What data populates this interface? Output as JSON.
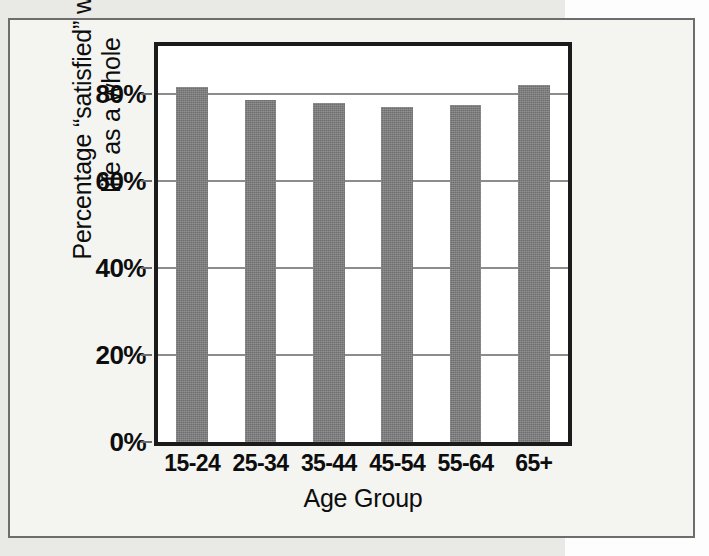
{
  "chart_data": {
    "type": "bar",
    "title": "",
    "subtitle": "",
    "xlabel": "Age Group",
    "ylabel": "Percentage “satisfied” with\nlife as a whole",
    "categories": [
      "15-24",
      "25-34",
      "35-44",
      "45-54",
      "55-64",
      "65+"
    ],
    "values": [
      81.5,
      78.5,
      78.0,
      77.0,
      77.5,
      82.0
    ],
    "series": [
      {
        "name": "Percentage satisfied with life as a whole",
        "values": [
          81.5,
          78.5,
          78.0,
          77.0,
          77.5,
          82.0
        ]
      }
    ],
    "ylim": [
      0,
      91
    ],
    "ytick_values": [
      0,
      20,
      40,
      60,
      80
    ],
    "ytick_labels": [
      "0%",
      "20%",
      "40%",
      "60%",
      "80%"
    ],
    "gridlines": {
      "horizontal": true,
      "vertical": false,
      "values": [
        20,
        40,
        60,
        80
      ]
    },
    "legend": {
      "visible": false,
      "position": "none",
      "entries": []
    },
    "annotations": [],
    "bar_color": "#7b7b7b",
    "gridline_color": "#8c8c8c",
    "axis_color": "#1b1b1b",
    "plot_background": "#ffffff",
    "figure_background": "#f4f4f1"
  },
  "figure": {
    "frame_border_color": "#6d6d6d",
    "page_background": "#e9e9e6"
  }
}
